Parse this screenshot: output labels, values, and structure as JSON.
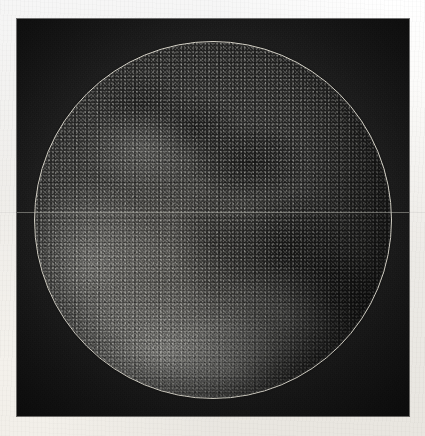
{
  "figure": {
    "kind": "astronomical-plate",
    "medium": "engraving / photogravure on paper",
    "visible_text": "",
    "paper_color": "#f8f6f1",
    "plate_color": "#1f1f1f",
    "limb_color": "#e2dfd4"
  },
  "plate": {
    "x": 17,
    "y": 19,
    "width": 392,
    "height": 397
  },
  "disc": {
    "center_x": 213,
    "center_y": 220,
    "radius": 178,
    "diameter": 356,
    "outline_stroke_px": 1
  },
  "features": [
    {
      "name": "southern-highlands",
      "tone": "bright",
      "cx_pct": 40,
      "cy_pct": 86
    },
    {
      "name": "south-western-highlands",
      "tone": "bright",
      "cx_pct": 16,
      "cy_pct": 62
    },
    {
      "name": "mare-upper-centre",
      "tone": "dark",
      "cx_pct": 60,
      "cy_pct": 34
    },
    {
      "name": "mare-central",
      "tone": "dark",
      "cx_pct": 50,
      "cy_pct": 56
    },
    {
      "name": "mare-lower-right",
      "tone": "dark",
      "cx_pct": 70,
      "cy_pct": 58
    },
    {
      "name": "south-east-limb-shadow",
      "tone": "shadow",
      "cx_pct": 84,
      "cy_pct": 72
    }
  ],
  "artifacts": {
    "scan_line_y": 212,
    "scan_line_label": "horizontal scan line"
  }
}
